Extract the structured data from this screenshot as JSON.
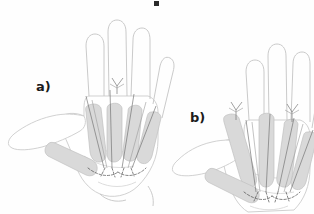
{
  "figure": {
    "type": "anatomical-line-drawing",
    "background_color": "#fefefe",
    "panel_count": 2
  },
  "panels": [
    {
      "id": "panel-a",
      "label": "a)",
      "hand": "hand-outline-a",
      "description": "left hand, palmar view, thumb abducted to the left",
      "shaded_structures": [
        "thumb-metacarpal",
        "index-metacarpal",
        "middle-metacarpal",
        "ring-metacarpal",
        "little-metacarpal"
      ],
      "marker_lines": "tendon-guide-lines",
      "dashed_contours": "distal-palmar-crease-dashed",
      "arrow_markers": 1
    },
    {
      "id": "panel-b",
      "label": "b)",
      "hand": "hand-outline-b",
      "description": "right hand, palmar view, thumb abducted to the left, rotated",
      "shaded_structures": [
        "thumb-metacarpal",
        "index-metacarpal",
        "middle-metacarpal",
        "ring-metacarpal",
        "little-metacarpal"
      ],
      "marker_lines": "tendon-guide-lines",
      "dashed_contours": "distal-palmar-crease-dashed",
      "arrow_markers": 2
    }
  ],
  "colors": {
    "outline_stroke": "#cfcfcf",
    "outline_stroke_dark": "#b6b6b6",
    "bone_fill": "#d9d9d9",
    "bone_fill_light": "#e2e2e2",
    "bone_stroke": "#c2c2c2",
    "guide_line": "#6f6f6f",
    "dashed_line": "#555555",
    "label_text": "#1b1b1b",
    "background": "#fefefe"
  },
  "artifacts": {
    "top_mark": "cropped-text-fragment"
  }
}
